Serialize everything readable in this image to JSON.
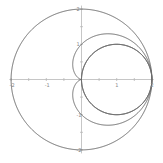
{
  "diagram": {
    "type": "polar-curves",
    "axes": {
      "x_ticks": [
        {
          "value": -2,
          "label": "-2"
        },
        {
          "value": -1,
          "label": "-1"
        },
        {
          "value": 1,
          "label": "1"
        },
        {
          "value": 2,
          "label": "2"
        }
      ],
      "y_ticks": [
        {
          "value": 2,
          "label": "2"
        },
        {
          "value": 1,
          "label": "1"
        },
        {
          "value": -1,
          "label": "-1"
        },
        {
          "value": -2,
          "label": "-2"
        }
      ]
    },
    "curves": [
      {
        "name": "outer-circle",
        "equation": "r = 2"
      },
      {
        "name": "cardioid",
        "equation": "r = 1 + cos(theta)"
      },
      {
        "name": "inner-circle",
        "equation": "r = 2cos(theta)"
      }
    ],
    "colors": {
      "curve": "#6a6a6a",
      "axis": "#b8b8b8",
      "background": "#ffffff"
    }
  }
}
